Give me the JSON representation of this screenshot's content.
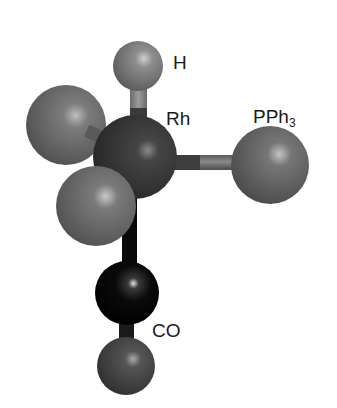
{
  "diagram": {
    "type": "ball-and-stick molecular model",
    "atoms": [
      {
        "id": "H",
        "label": "H",
        "cx": 138,
        "cy": 66,
        "r": 25,
        "color": "#7a7a7a",
        "highlight": "#c8c8c8"
      },
      {
        "id": "L1",
        "label": "",
        "cx": 66,
        "cy": 125,
        "r": 40,
        "color": "#6e6e6e",
        "highlight": "#bdbdbd"
      },
      {
        "id": "Rh",
        "label": "Rh",
        "cx": 135,
        "cy": 157,
        "r": 42,
        "color": "#3a3a3a",
        "highlight": "#8c8c8c"
      },
      {
        "id": "P",
        "label": "PPh3",
        "cx": 270,
        "cy": 165,
        "r": 39,
        "color": "#6a6a6a",
        "highlight": "#c0c0c0"
      },
      {
        "id": "L2",
        "label": "",
        "cx": 96,
        "cy": 206,
        "r": 40,
        "color": "#707070",
        "highlight": "#c4c4c4"
      },
      {
        "id": "C",
        "label": "",
        "cx": 127,
        "cy": 293,
        "r": 32,
        "color": "#0a0a0a",
        "highlight": "#d8d8d8"
      },
      {
        "id": "O",
        "label": "",
        "cx": 126,
        "cy": 366,
        "r": 29,
        "color": "#4a4a4a",
        "highlight": "#a8a8a8"
      }
    ],
    "labels": {
      "h": "H",
      "rh": "Rh",
      "pph3_main": "PPh",
      "pph3_sub": "3",
      "co": "CO"
    }
  }
}
